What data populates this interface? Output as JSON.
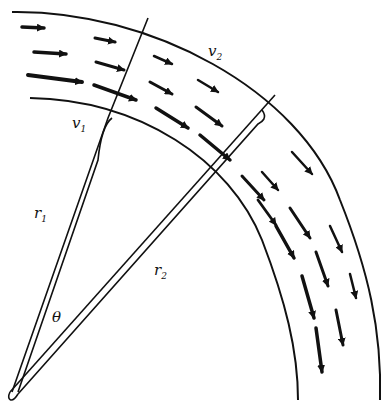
{
  "diagram": {
    "type": "velocity field in curved channel",
    "labels": {
      "v1": {
        "base": "v",
        "sub": "1"
      },
      "v2": {
        "base": "v",
        "sub": "2"
      },
      "r1": {
        "base": "r",
        "sub": "1"
      },
      "r2": {
        "base": "r",
        "sub": "2"
      },
      "theta": "θ"
    },
    "colors": {
      "ink": "#111111",
      "background": "#ffffff"
    }
  }
}
